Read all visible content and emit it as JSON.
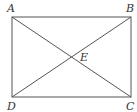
{
  "diagram": {
    "type": "geometry",
    "shape": "rectangle with diagonals",
    "points": [
      {
        "name": "A",
        "x": 12,
        "y": 17,
        "label_x": 7,
        "label_y": 11
      },
      {
        "name": "B",
        "x": 131,
        "y": 17,
        "label_x": 126,
        "label_y": 11
      },
      {
        "name": "C",
        "x": 131,
        "y": 97,
        "label_x": 126,
        "label_y": 110
      },
      {
        "name": "D",
        "x": 12,
        "y": 97,
        "label_x": 7,
        "label_y": 110
      },
      {
        "name": "E",
        "x": 71.5,
        "y": 57,
        "label_x": 80,
        "label_y": 60
      }
    ],
    "segments": [
      "AB",
      "BC",
      "CD",
      "DA",
      "AC",
      "BD"
    ],
    "labels": {
      "A": "A",
      "B": "B",
      "C": "C",
      "D": "D",
      "E": "E"
    }
  }
}
